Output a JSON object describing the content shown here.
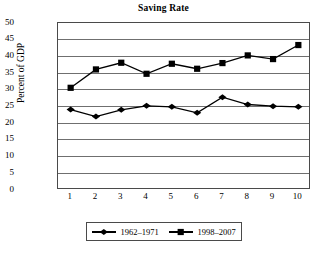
{
  "chart_data": {
    "type": "line",
    "title": "Saving Rate",
    "xlabel": "",
    "ylabel": "Percent of GDP",
    "categories": [
      "1",
      "2",
      "3",
      "4",
      "5",
      "6",
      "7",
      "8",
      "9",
      "10"
    ],
    "x": [
      1,
      2,
      3,
      4,
      5,
      6,
      7,
      8,
      9,
      10
    ],
    "xlim": [
      0.5,
      10.5
    ],
    "ylim": [
      0,
      50
    ],
    "yticks": [
      0,
      5,
      10,
      15,
      20,
      25,
      30,
      35,
      40,
      45,
      50
    ],
    "grid": "horizontal",
    "legend_position": "bottom",
    "series": [
      {
        "name": "1962–1971",
        "marker": "diamond",
        "color": "#000000",
        "values": [
          24.1,
          22.0,
          24.0,
          25.2,
          24.9,
          23.1,
          27.8,
          25.6,
          25.1,
          24.9
        ]
      },
      {
        "name": "1998–2007",
        "marker": "square",
        "color": "#000000",
        "values": [
          30.6,
          36.1,
          38.1,
          34.8,
          37.8,
          36.3,
          38.0,
          40.3,
          39.2,
          43.4
        ]
      }
    ]
  },
  "colors": {
    "axis": "#4a4a4a",
    "grid": "#6f6f6f",
    "series": "#000000",
    "background": "#ffffff"
  }
}
